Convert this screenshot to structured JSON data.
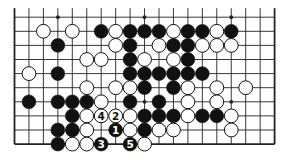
{
  "diagram": {
    "type": "go-board-partial",
    "columns": 19,
    "rows_shown": 10,
    "edges": {
      "left": true,
      "right": true,
      "bottom": true,
      "top": false
    },
    "colors": {
      "background": "#ffffff",
      "line": "#222222",
      "black": "#111111",
      "white": "#ffffff"
    },
    "star_points": [
      [
        3,
        0
      ],
      [
        9,
        0
      ],
      [
        15,
        0
      ],
      [
        9,
        6
      ],
      [
        15,
        6
      ]
    ],
    "stones": [
      {
        "c": 2,
        "r": 1,
        "color": "W"
      },
      {
        "c": 4,
        "r": 1,
        "color": "W"
      },
      {
        "c": 6,
        "r": 1,
        "color": "B"
      },
      {
        "c": 7,
        "r": 1,
        "color": "W"
      },
      {
        "c": 8,
        "r": 1,
        "color": "B"
      },
      {
        "c": 9,
        "r": 1,
        "color": "B"
      },
      {
        "c": 10,
        "r": 1,
        "color": "B"
      },
      {
        "c": 11,
        "r": 1,
        "color": "W"
      },
      {
        "c": 12,
        "r": 1,
        "color": "B"
      },
      {
        "c": 13,
        "r": 1,
        "color": "B"
      },
      {
        "c": 14,
        "r": 1,
        "color": "W"
      },
      {
        "c": 15,
        "r": 1,
        "color": "B"
      },
      {
        "c": 3,
        "r": 2,
        "color": "B"
      },
      {
        "c": 7,
        "r": 2,
        "color": "W"
      },
      {
        "c": 8,
        "r": 2,
        "color": "B"
      },
      {
        "c": 10,
        "r": 2,
        "color": "W"
      },
      {
        "c": 11,
        "r": 2,
        "color": "B"
      },
      {
        "c": 12,
        "r": 2,
        "color": "B"
      },
      {
        "c": 13,
        "r": 2,
        "color": "W"
      },
      {
        "c": 14,
        "r": 2,
        "color": "W"
      },
      {
        "c": 15,
        "r": 2,
        "color": "W"
      },
      {
        "c": 5,
        "r": 3,
        "color": "W"
      },
      {
        "c": 6,
        "r": 3,
        "color": "W"
      },
      {
        "c": 8,
        "r": 3,
        "color": "B"
      },
      {
        "c": 9,
        "r": 3,
        "color": "W"
      },
      {
        "c": 11,
        "r": 3,
        "color": "W"
      },
      {
        "c": 12,
        "r": 3,
        "color": "B"
      },
      {
        "c": 1,
        "r": 4,
        "color": "W"
      },
      {
        "c": 3,
        "r": 4,
        "color": "B"
      },
      {
        "c": 8,
        "r": 4,
        "color": "B"
      },
      {
        "c": 9,
        "r": 4,
        "color": "B"
      },
      {
        "c": 10,
        "r": 4,
        "color": "B"
      },
      {
        "c": 11,
        "r": 4,
        "color": "B"
      },
      {
        "c": 12,
        "r": 4,
        "color": "B"
      },
      {
        "c": 13,
        "r": 4,
        "color": "B"
      },
      {
        "c": 5,
        "r": 5,
        "color": "W"
      },
      {
        "c": 7,
        "r": 5,
        "color": "W"
      },
      {
        "c": 8,
        "r": 5,
        "color": "W"
      },
      {
        "c": 9,
        "r": 5,
        "color": "B"
      },
      {
        "c": 11,
        "r": 5,
        "color": "B"
      },
      {
        "c": 12,
        "r": 5,
        "color": "W"
      },
      {
        "c": 14,
        "r": 5,
        "color": "W"
      },
      {
        "c": 16,
        "r": 5,
        "color": "W"
      },
      {
        "c": 1,
        "r": 6,
        "color": "B"
      },
      {
        "c": 3,
        "r": 6,
        "color": "B"
      },
      {
        "c": 4,
        "r": 6,
        "color": "B"
      },
      {
        "c": 5,
        "r": 6,
        "color": "B"
      },
      {
        "c": 6,
        "r": 6,
        "color": "W"
      },
      {
        "c": 8,
        "r": 6,
        "color": "B"
      },
      {
        "c": 10,
        "r": 6,
        "color": "B"
      },
      {
        "c": 12,
        "r": 6,
        "color": "W"
      },
      {
        "c": 14,
        "r": 6,
        "color": "W"
      },
      {
        "c": 4,
        "r": 7,
        "color": "B"
      },
      {
        "c": 5,
        "r": 7,
        "color": "W"
      },
      {
        "c": 6,
        "r": 7,
        "color": "W",
        "label": "4"
      },
      {
        "c": 7,
        "r": 7,
        "color": "W",
        "label": "2"
      },
      {
        "c": 8,
        "r": 7,
        "color": "W"
      },
      {
        "c": 9,
        "r": 7,
        "color": "B"
      },
      {
        "c": 10,
        "r": 7,
        "color": "B"
      },
      {
        "c": 11,
        "r": 7,
        "color": "B"
      },
      {
        "c": 12,
        "r": 7,
        "color": "W"
      },
      {
        "c": 13,
        "r": 7,
        "color": "B"
      },
      {
        "c": 14,
        "r": 7,
        "color": "B"
      },
      {
        "c": 15,
        "r": 7,
        "color": "W"
      },
      {
        "c": 3,
        "r": 8,
        "color": "B"
      },
      {
        "c": 4,
        "r": 8,
        "color": "B"
      },
      {
        "c": 5,
        "r": 8,
        "color": "W"
      },
      {
        "c": 7,
        "r": 8,
        "color": "B",
        "label": "1"
      },
      {
        "c": 8,
        "r": 8,
        "color": "W"
      },
      {
        "c": 9,
        "r": 8,
        "color": "B"
      },
      {
        "c": 10,
        "r": 8,
        "color": "W"
      },
      {
        "c": 11,
        "r": 8,
        "color": "W"
      },
      {
        "c": 15,
        "r": 8,
        "color": "W"
      },
      {
        "c": 3,
        "r": 9,
        "color": "B"
      },
      {
        "c": 4,
        "r": 9,
        "color": "W"
      },
      {
        "c": 5,
        "r": 9,
        "color": "W"
      },
      {
        "c": 6,
        "r": 9,
        "color": "B",
        "label": "3"
      },
      {
        "c": 8,
        "r": 9,
        "color": "B",
        "label": "5"
      },
      {
        "c": 9,
        "r": 9,
        "color": "W"
      }
    ],
    "move_labels": [
      "1",
      "2",
      "3",
      "4",
      "5"
    ]
  }
}
